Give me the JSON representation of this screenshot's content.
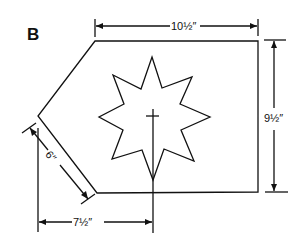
{
  "figure": {
    "panel_label": "B",
    "shape": "irregular hexagon (pentagon-like panel) with eight-point star and cross",
    "dimensions": {
      "top_width": "10½″",
      "right_height": "9½″",
      "slanted_edge": "6″",
      "bottom_offset": "7½″"
    },
    "colors": {
      "line": "#111111",
      "background": "#ffffff"
    }
  }
}
